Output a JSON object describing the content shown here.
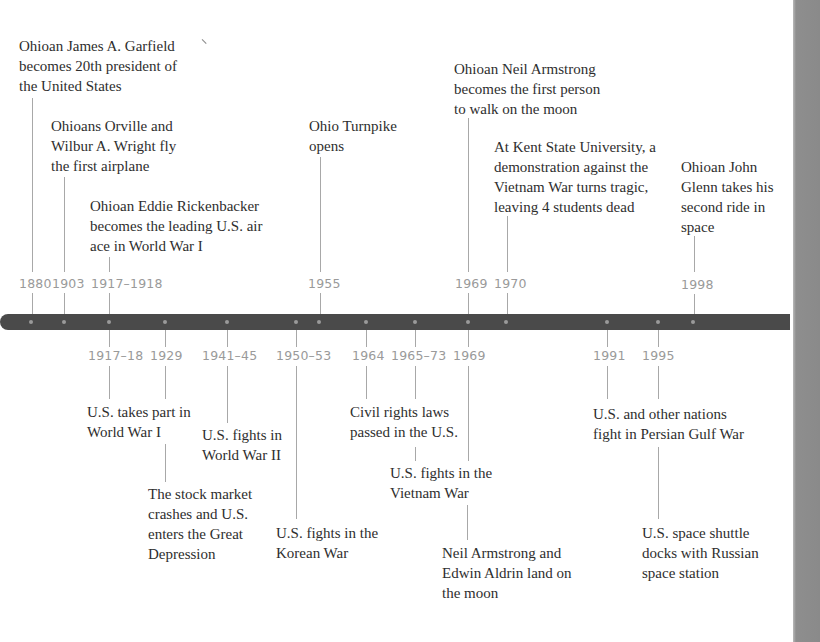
{
  "timeline": {
    "colors": {
      "bar": "#4a4a4a",
      "dot": "#9a9a9a",
      "year_text": "#9a9a9a",
      "connector": "#a8a8a8",
      "label_text": "#2e2e2e"
    },
    "above": [
      {
        "year": "1880",
        "label": "Ohioan James A. Garfield\nbecomes 20th president of\nthe United States"
      },
      {
        "year": "1903",
        "label": "Ohioans Orville and\nWilbur A. Wright fly\nthe first airplane"
      },
      {
        "year": "1917–1918",
        "label": "Ohioan Eddie Rickenbacker\nbecomes the leading U.S. air\nace in World War I"
      },
      {
        "year": "1955",
        "label": "Ohio Turnpike\nopens"
      },
      {
        "year": "1969",
        "label": "Ohioan Neil Armstrong\nbecomes the first person\nto walk on the moon"
      },
      {
        "year": "1970",
        "label": "At Kent State University, a\ndemonstration against the\nVietnam War turns tragic,\nleaving 4 students dead"
      },
      {
        "year": "1998",
        "label": "Ohioan John\nGlenn takes his\nsecond ride in\nspace"
      }
    ],
    "below": [
      {
        "year": "1917–18",
        "label": "U.S. takes part in\nWorld War I"
      },
      {
        "year": "1929",
        "label": "The stock market\ncrashes and U.S.\nenters the Great\nDepression"
      },
      {
        "year": "1941–45",
        "label": "U.S. fights in\nWorld War II"
      },
      {
        "year": "1950–53",
        "label": "U.S. fights in the\nKorean War"
      },
      {
        "year": "1964",
        "label": "Civil rights laws\npassed in the U.S."
      },
      {
        "year": "1965–73",
        "label": "U.S. fights in the\nVietnam War"
      },
      {
        "year": "1969",
        "label": "Neil Armstrong and\nEdwin Aldrin land on\nthe moon"
      },
      {
        "year": "1991",
        "label": "U.S. and other nations\nfight in Persian Gulf War"
      },
      {
        "year": "1995",
        "label": "U.S. space shuttle\ndocks with Russian\nspace station"
      }
    ]
  }
}
